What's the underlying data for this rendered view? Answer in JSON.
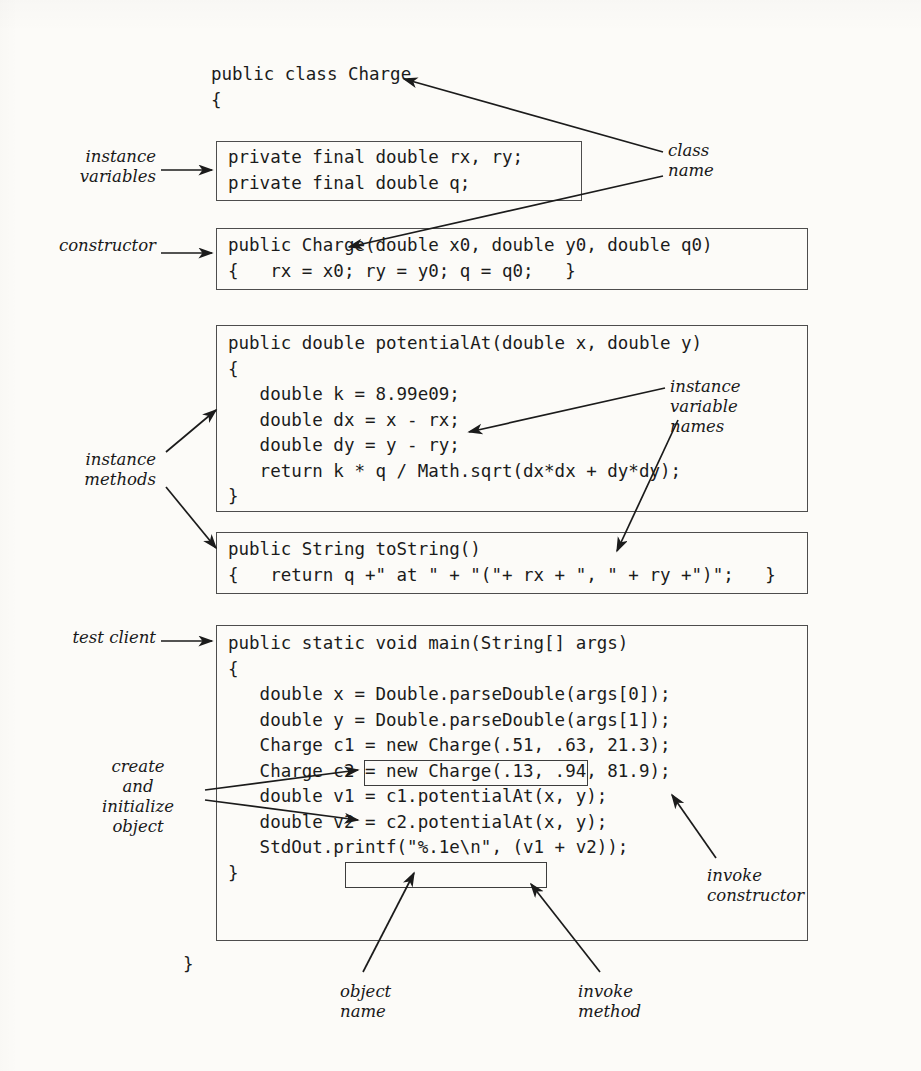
{
  "page": {
    "background": "#fcfbf8",
    "ink": "#1b1b1b",
    "rule_color": "#4d4d4d"
  },
  "code": {
    "class_header": "public class Charge",
    "class_open_brace": "{",
    "class_close_brace": "}",
    "instance_variables": [
      "private final double rx, ry;",
      "private final double q;"
    ],
    "constructor": [
      "public Charge(double x0, double y0, double q0)",
      "{   rx = x0; ry = y0; q = q0;   }"
    ],
    "potential_at": [
      "public double potentialAt(double x, double y)",
      "{",
      "   double k = 8.99e09;",
      "   double dx = x - rx;",
      "   double dy = y - ry;",
      "   return k * q / Math.sqrt(dx*dx + dy*dy);",
      "}"
    ],
    "to_string": [
      "public String toString()",
      "{   return q +\" at \" + \"(\"+ rx + \", \" + ry +\")\";   }"
    ],
    "main": [
      "public static void main(String[] args)",
      "{",
      "   double x = Double.parseDouble(args[0]);",
      "   double y = Double.parseDouble(args[1]);",
      "   Charge c1 = new Charge(.51, .63, 21.3);",
      "   Charge c2 = new Charge(.13, .94, 81.9);",
      "   double v1 = c1.potentialAt(x, y);",
      "   double v2 = c2.potentialAt(x, y);",
      "   StdOut.printf(\"%.1e\\n\", (v1 + v2));",
      "}"
    ]
  },
  "annotations": {
    "instance_variables": "instance\nvariables",
    "constructor": "constructor",
    "instance_methods": "instance\nmethods",
    "test_client": "test client",
    "create_initialize_object": "create\nand\ninitialize\nobject",
    "class_name": "class\nname",
    "instance_variable_names": "instance\nvariable\nnames",
    "invoke_constructor": "invoke\nconstructor",
    "object_name": "object\nname",
    "invoke_method": "invoke\nmethod"
  }
}
